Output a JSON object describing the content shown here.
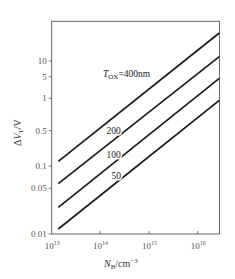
{
  "chart_data": {
    "type": "line",
    "title": "",
    "xlabel": "N_B/cm^-3",
    "ylabel": "ΔV_T/V",
    "x_scale": "log",
    "y_scale": "log",
    "xlim": [
      10000000000000.0,
      2.8e+16
    ],
    "ylim": [
      0.01,
      40
    ],
    "grid": false,
    "legend": "none (inline curve labels)",
    "x_ticks": [
      {
        "label_base": "10",
        "label_exp": "13",
        "value": 10000000000000.0
      },
      {
        "label_base": "10",
        "label_exp": "14",
        "value": 100000000000000.0
      },
      {
        "label_base": "10",
        "label_exp": "15",
        "value": 1000000000000000.0
      },
      {
        "label_base": "10",
        "label_exp": "16",
        "value": 1e+16
      }
    ],
    "y_ticks": [
      "10",
      "5",
      "1",
      "0.5",
      "0.1",
      "0.05",
      "0.01"
    ],
    "annotation_title": {
      "prefix": "T",
      "sub": "OX",
      "suffix": "=400nm"
    },
    "series": [
      {
        "name": "400",
        "label": "T_OX=400nm",
        "x": [
          14000000000000.0,
          2.8e+16
        ],
        "y": [
          0.11,
          30
        ]
      },
      {
        "name": "200",
        "label": "200",
        "x": [
          14000000000000.0,
          2.8e+16
        ],
        "y": [
          0.055,
          13
        ]
      },
      {
        "name": "100",
        "label": "100",
        "x": [
          14000000000000.0,
          2.8e+16
        ],
        "y": [
          0.027,
          4.5
        ]
      },
      {
        "name": "50",
        "label": "50",
        "x": [
          14000000000000.0,
          2.8e+16
        ],
        "y": [
          0.011,
          0.95
        ]
      }
    ]
  },
  "render": {
    "frame": {
      "x1": 51.7,
      "y1": 21.3,
      "x2": 219.5,
      "y2": 234
    },
    "x_tick_px": [
      51.7,
      100,
      149,
      197.7
    ],
    "y_tick_px": [
      61,
      76.7,
      98.3,
      130.7,
      166,
      188.3,
      234
    ],
    "lines_px": [
      {
        "x1": 58.3,
        "y1": 161.3,
        "x2": 219.3,
        "y2": 33
      },
      {
        "x1": 58.3,
        "y1": 183.7,
        "x2": 219.3,
        "y2": 56.7
      },
      {
        "x1": 58.3,
        "y1": 207.3,
        "x2": 219.3,
        "y2": 78.3
      },
      {
        "x1": 58.3,
        "y1": 229,
        "x2": 219.3,
        "y2": 100.3
      }
    ],
    "labels_px": [
      {
        "x": 106.5,
        "y": 133.5
      },
      {
        "x": 106.5,
        "y": 157.5
      },
      {
        "x": 111.5,
        "y": 178.5
      }
    ],
    "line_color": "#1a1a1a",
    "axis_color": "#555555"
  }
}
